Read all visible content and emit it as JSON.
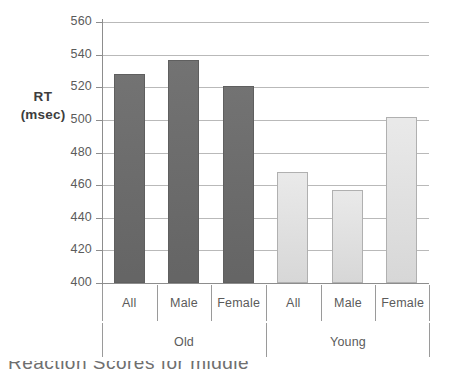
{
  "chart_data": {
    "type": "bar",
    "title": "",
    "xlabel": "",
    "ylabel": "RT (msec)",
    "ylim": [
      400,
      560
    ],
    "ytick_step": 20,
    "yticks": [
      560,
      540,
      520,
      500,
      480,
      460,
      440,
      420,
      400
    ],
    "grid": true,
    "legend": "none",
    "categories": [
      "All",
      "Male",
      "Female",
      "All",
      "Male",
      "Female"
    ],
    "groups": [
      {
        "name": "Old",
        "categories": [
          "All",
          "Male",
          "Female"
        ],
        "values": [
          528,
          537,
          521
        ],
        "color": "#6a6a6a"
      },
      {
        "name": "Young",
        "categories": [
          "All",
          "Male",
          "Female"
        ],
        "values": [
          468,
          457,
          502
        ],
        "color": "#dedede"
      }
    ],
    "values": [
      528,
      537,
      521,
      468,
      457,
      502
    ],
    "bars": [
      {
        "group": "Old",
        "category": "All",
        "value": 528,
        "style": "dark"
      },
      {
        "group": "Old",
        "category": "Male",
        "value": 537,
        "style": "dark"
      },
      {
        "group": "Old",
        "category": "Female",
        "value": 521,
        "style": "dark"
      },
      {
        "group": "Young",
        "category": "All",
        "value": 468,
        "style": "light"
      },
      {
        "group": "Young",
        "category": "Male",
        "value": 457,
        "style": "light"
      },
      {
        "group": "Young",
        "category": "Female",
        "value": 502,
        "style": "light"
      }
    ]
  },
  "axis": {
    "y_title_line1": "RT",
    "y_title_line2": "(msec)",
    "tick_labels": [
      "560",
      "540",
      "520",
      "500",
      "480",
      "460",
      "440",
      "420",
      "400"
    ]
  },
  "category_labels": [
    "All",
    "Male",
    "Female",
    "All",
    "Male",
    "Female"
  ],
  "group_labels": [
    "Old",
    "Young"
  ],
  "colors": {
    "old_bar": "#6a6a6a",
    "young_bar": "#dedede",
    "young_bar_border": "#b0b0b0",
    "gridline": "#b9b9b9",
    "axis": "#8d8d8d",
    "text": "#5b5b5b",
    "background": "#ffffff"
  },
  "caption_fragment": "Reaction Scores for middle"
}
